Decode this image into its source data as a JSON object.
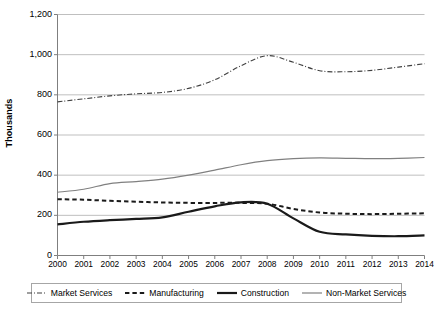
{
  "chart_data": {
    "type": "line",
    "title": "",
    "subtitle": "",
    "xlabel": "",
    "ylabel": "Thousands",
    "x": [
      2000,
      2001,
      2002,
      2003,
      2004,
      2005,
      2006,
      2007,
      2008,
      2009,
      2010,
      2011,
      2012,
      2013,
      2014
    ],
    "xticklabels": [
      "2000",
      "2001",
      "2002",
      "2003",
      "2004",
      "2005",
      "2006",
      "2007",
      "2008",
      "2009",
      "2010",
      "2011",
      "2012",
      "2013",
      "2014"
    ],
    "yticklabels": [
      "1,200",
      "1,000",
      "800",
      "600",
      "400",
      "200",
      "0"
    ],
    "yticks": [
      1200,
      1000,
      800,
      600,
      400,
      200,
      0
    ],
    "ylim": [
      0,
      1200
    ],
    "xlim": [
      2000,
      2014
    ],
    "grid": "horizontal",
    "legend_position": "bottom",
    "series": [
      {
        "name": "Market Services",
        "style": "dash-dot",
        "color": "#404040",
        "width": 1.1,
        "values": [
          765,
          780,
          795,
          805,
          812,
          832,
          875,
          945,
          995,
          962,
          920,
          915,
          922,
          938,
          955
        ]
      },
      {
        "name": "Manufacturing",
        "style": "dashed",
        "color": "#1a1a1a",
        "width": 2.0,
        "values": [
          280,
          278,
          272,
          268,
          264,
          262,
          262,
          262,
          258,
          232,
          214,
          208,
          206,
          208,
          210
        ]
      },
      {
        "name": "Construction",
        "style": "solid",
        "color": "#1a1a1a",
        "width": 2.2,
        "values": [
          155,
          168,
          176,
          182,
          190,
          218,
          245,
          265,
          258,
          185,
          118,
          105,
          98,
          96,
          100
        ]
      },
      {
        "name": "Non-Market Services",
        "style": "solid",
        "color": "#808080",
        "width": 1.2,
        "values": [
          315,
          330,
          358,
          368,
          380,
          400,
          425,
          452,
          472,
          482,
          486,
          484,
          482,
          484,
          488
        ]
      }
    ]
  },
  "legend": {
    "items": [
      {
        "label": "Market Services",
        "swatch": "dash-dot-swatch"
      },
      {
        "label": "Manufacturing",
        "swatch": "dashed-swatch"
      },
      {
        "label": "Construction",
        "swatch": "solid-thick-swatch"
      },
      {
        "label": "Non-Market Services",
        "swatch": "solid-thin-swatch"
      }
    ]
  },
  "axes": {
    "y_title": "Thousands"
  }
}
